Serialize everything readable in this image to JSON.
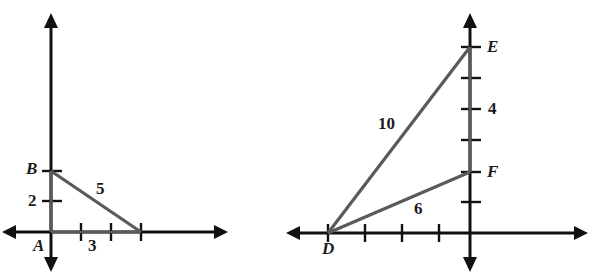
{
  "page": {
    "width": 600,
    "height": 277,
    "background": "#ffffff",
    "axis_color": "#111111",
    "segment_color": "#5a5a5a",
    "label_color": "#1c1c1c"
  },
  "figures": [
    {
      "id": "left-figure",
      "name": "triangle-ab-figure",
      "origin_label": "A",
      "vertex_labels": [
        "A",
        "B"
      ],
      "axis_tick_labels": [
        "2",
        "3"
      ],
      "side_labels": [
        "5"
      ],
      "labels": {
        "A": "A",
        "B": "B",
        "two": "2",
        "three": "3",
        "five": "5"
      },
      "geometry": {
        "origin_px": [
          51,
          232
        ],
        "unit_px": 30,
        "y_axis_x_px": 51,
        "x_axis_y_px": 232,
        "points": {
          "A": [
            0,
            0
          ],
          "B": [
            0,
            4
          ],
          "C": [
            3,
            0
          ]
        },
        "segments": [
          {
            "from": "A",
            "to": "B"
          },
          {
            "from": "A",
            "to": "C"
          },
          {
            "from": "B",
            "to": "C",
            "label": "5"
          }
        ],
        "x_ticks": [
          1,
          2,
          3
        ],
        "y_ticks": [
          2,
          4
        ]
      }
    },
    {
      "id": "right-figure",
      "name": "triangle-def-figure",
      "origin_label": "",
      "vertex_labels": [
        "D",
        "E",
        "F"
      ],
      "axis_tick_labels": [
        "4"
      ],
      "side_labels": [
        "10",
        "6"
      ],
      "labels": {
        "D": "D",
        "E": "E",
        "F": "F",
        "four": "4",
        "ten": "10",
        "six": "6"
      },
      "geometry": {
        "origin_px": [
          470,
          233
        ],
        "unit_px": 37,
        "y_axis_x_px": 470,
        "x_axis_y_px": 233,
        "points": {
          "D": [
            -3.85,
            0
          ],
          "E": [
            0,
            5.05
          ],
          "F": [
            0,
            1.65
          ]
        },
        "segments": [
          {
            "from": "D",
            "to": "E",
            "label": "10"
          },
          {
            "from": "D",
            "to": "F",
            "label": "6"
          }
        ],
        "x_ticks": [
          -3.85,
          -2.85,
          -1.85,
          -0.85
        ],
        "y_ticks": [
          0.85,
          1.65,
          2.5,
          3.3,
          4.2,
          5.05
        ]
      }
    }
  ]
}
